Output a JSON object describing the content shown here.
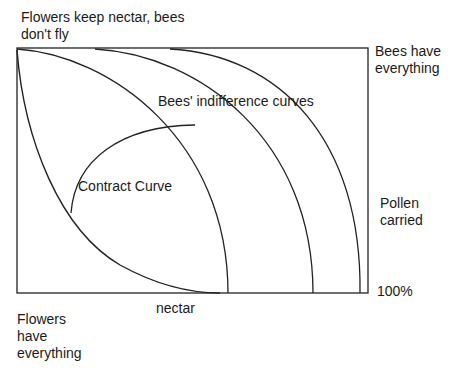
{
  "labels": {
    "top_left_line1": "Flowers keep nectar, bees",
    "top_left_line2": "don't fly",
    "top_right_line1": "Bees have",
    "top_right_line2": "everything",
    "indifference": "Bees' indifference curves",
    "contract": "Contract Curve",
    "pollen_line1": "Pollen",
    "pollen_line2": "carried",
    "hundred": "100%",
    "nectar": "nectar",
    "bottom_left_line1": "Flowers",
    "bottom_left_line2": "have",
    "bottom_left_line3": "everything"
  }
}
